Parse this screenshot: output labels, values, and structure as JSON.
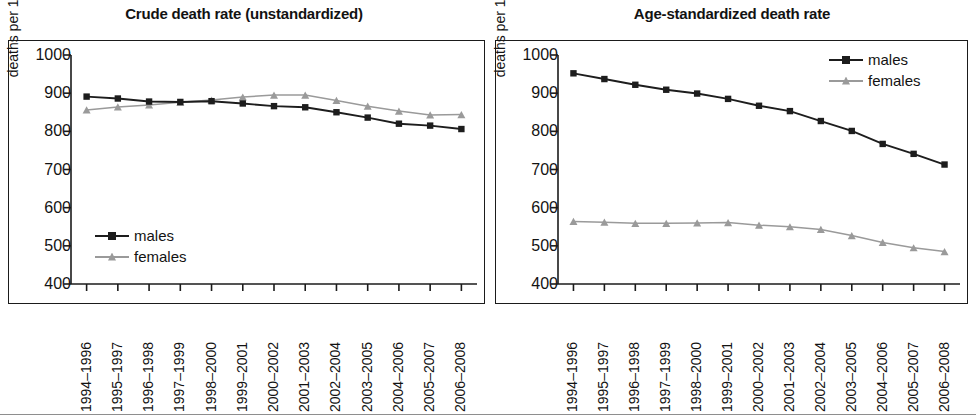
{
  "figure": {
    "panels": [
      {
        "id": "crude",
        "title": "Crude death rate (unstandardized)"
      },
      {
        "id": "age-standardized",
        "title": "Age-standardized death rate"
      }
    ]
  },
  "axes": {
    "ylabel": "deaths per 100,000",
    "yticks": [
      "1000",
      "900",
      "800",
      "700",
      "600",
      "500",
      "400"
    ],
    "xticks": [
      "1994–1996",
      "1995–1997",
      "1996–1998",
      "1997–1999",
      "1998–2000",
      "1999–2001",
      "2000–2002",
      "2001–2003",
      "2002–2004",
      "2003–2005",
      "2004–2006",
      "2005–2007",
      "2006–2008"
    ]
  },
  "legend": {
    "males_label": "males",
    "females_label": "females"
  },
  "colors": {
    "males": "#1d1d1d",
    "females": "#9a9a9a",
    "frame": "#1b1b1b",
    "text": "#121212"
  },
  "chart_data": [
    {
      "type": "line",
      "title": "Crude death rate (unstandardized)",
      "xlabel": "",
      "ylabel": "deaths per 100,000",
      "ylim": [
        400,
        1000
      ],
      "ytick_step": 100,
      "grid": false,
      "legend_position": "inside-lower-left",
      "categories": [
        "1994–1996",
        "1995–1997",
        "1996–1998",
        "1997–1999",
        "1998–2000",
        "1999–2001",
        "2000–2002",
        "2001–2003",
        "2002–2004",
        "2003–2005",
        "2004–2006",
        "2005–2007",
        "2006–2008"
      ],
      "series": [
        {
          "name": "males",
          "marker": "square",
          "color": "#1d1d1d",
          "values": [
            891,
            886,
            878,
            877,
            879,
            873,
            866,
            863,
            850,
            836,
            820,
            815,
            806
          ]
        },
        {
          "name": "females",
          "marker": "triangle",
          "color": "#9a9a9a",
          "values": [
            856,
            864,
            869,
            876,
            882,
            890,
            895,
            895,
            881,
            866,
            853,
            843,
            844
          ]
        }
      ]
    },
    {
      "type": "line",
      "title": "Age-standardized death rate",
      "xlabel": "",
      "ylabel": "deaths per 100,000",
      "ylim": [
        400,
        1000
      ],
      "ytick_step": 100,
      "grid": false,
      "legend_position": "inside-upper-right",
      "categories": [
        "1994–1996",
        "1995–1997",
        "1996–1998",
        "1997–1999",
        "1998–2000",
        "1999–2001",
        "2000–2002",
        "2001–2003",
        "2002–2004",
        "2003–2005",
        "2004–2006",
        "2005–2007",
        "2006–2008"
      ],
      "series": [
        {
          "name": "males",
          "marker": "square",
          "color": "#1d1d1d",
          "values": [
            952,
            937,
            922,
            909,
            899,
            885,
            867,
            853,
            827,
            801,
            767,
            741,
            713
          ]
        },
        {
          "name": "females",
          "marker": "triangle",
          "color": "#9a9a9a",
          "values": [
            564,
            562,
            559,
            559,
            560,
            561,
            554,
            550,
            543,
            527,
            509,
            495,
            485
          ]
        }
      ]
    }
  ]
}
